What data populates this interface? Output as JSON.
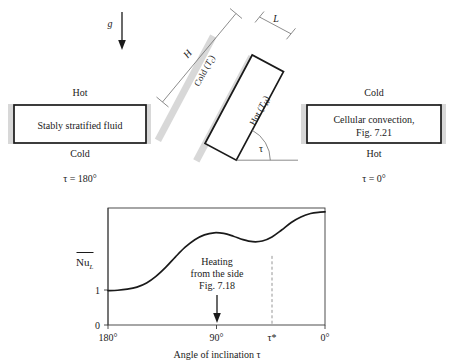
{
  "figure": {
    "gravity_label": "g",
    "left_panel": {
      "top_label": "Hot",
      "box_text": "Stably stratified fluid",
      "bottom_label": "Cold",
      "angle_label": "τ = 180°"
    },
    "right_panel": {
      "top_label": "Cold",
      "box_text_line1": "Cellular convection,",
      "box_text_line2": "Fig. 7.21",
      "bottom_label": "Hot",
      "angle_label": "τ = 0°"
    },
    "tilted_panel": {
      "height_label": "H",
      "thickness_label": "L",
      "cold_wall_label": "Cold (",
      "cold_wall_symbol": "T",
      "cold_wall_sub": "c",
      "cold_wall_close": ")",
      "hot_wall_label": "Hot (",
      "hot_wall_symbol": "T",
      "hot_wall_sub": "H",
      "hot_wall_close": ")",
      "angle_symbol": "τ"
    },
    "colors": {
      "ink": "#1a1a1a",
      "gray_band": "#d8d8d8",
      "dimension_line": "#6f6f6f",
      "axis": "#3a3a3a",
      "dashed": "#8a8a8a"
    }
  },
  "chart_data": {
    "type": "line",
    "title": "",
    "xlabel": "Angle of inclination τ",
    "ylabel": "Nu_L",
    "ylabel_display": "Nu",
    "ylabel_sub": "L",
    "xtick_labels": [
      "180°",
      "90°",
      "τ*",
      "0°"
    ],
    "xtick_values": [
      180,
      90,
      60,
      0
    ],
    "ytick_labels": [
      "0",
      "1"
    ],
    "ytick_values": [
      0,
      1
    ],
    "xlim": [
      180,
      0
    ],
    "ylim": [
      0,
      3.4
    ],
    "grid": false,
    "legend": false,
    "annotation": {
      "line1": "Heating",
      "line2": "from the side",
      "line3": "Fig. 7.18",
      "arrow_at_x": 90
    },
    "dashed_vertical_at": "τ*",
    "series": [
      {
        "name": "Mean Nusselt number",
        "x": [
          180,
          172,
          164,
          156,
          148,
          140,
          132,
          124,
          116,
          108,
          100,
          92,
          84,
          76,
          68,
          60,
          52,
          44,
          36,
          28,
          20,
          12,
          4,
          0
        ],
        "values": [
          1.0,
          1.01,
          1.04,
          1.1,
          1.22,
          1.42,
          1.68,
          1.98,
          2.26,
          2.48,
          2.62,
          2.68,
          2.66,
          2.58,
          2.48,
          2.42,
          2.44,
          2.56,
          2.76,
          2.98,
          3.14,
          3.24,
          3.28,
          3.29
        ]
      }
    ]
  }
}
